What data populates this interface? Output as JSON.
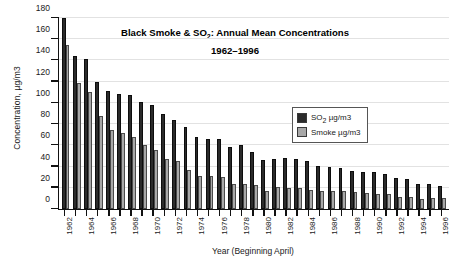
{
  "chart_data": {
    "type": "bar",
    "title": "Black Smoke & SO2: Annual Mean Concentrations",
    "title_line1": "Black Smoke & SO",
    "title_line1_sub": "2",
    "title_line1_rest": ": Annual Mean Concentrations",
    "subtitle": "1962–1996",
    "xlabel": "Year (Beginning April)",
    "ylabel": "Concentration, µg/m3",
    "ylim": [
      0,
      180
    ],
    "ytick_step": 20,
    "yticks": [
      0,
      20,
      40,
      60,
      80,
      100,
      120,
      140,
      160,
      180
    ],
    "grid": true,
    "legend_position": "upper-right-inside",
    "categories": [
      "1962",
      "1963",
      "1964",
      "1965",
      "1966",
      "1967",
      "1968",
      "1969",
      "1970",
      "1971",
      "1972",
      "1973",
      "1974",
      "1975",
      "1976",
      "1977",
      "1978",
      "1979",
      "1980",
      "1981",
      "1982",
      "1983",
      "1984",
      "1985",
      "1986",
      "1987",
      "1988",
      "1989",
      "1990",
      "1991",
      "1992",
      "1993",
      "1994",
      "1995",
      "1996"
    ],
    "xtick_labels": [
      "1962",
      "",
      "1964",
      "",
      "1966",
      "",
      "1968",
      "",
      "1970",
      "",
      "1972",
      "",
      "1974",
      "",
      "1976",
      "",
      "1978",
      "",
      "1980",
      "",
      "1982",
      "",
      "1984",
      "",
      "1986",
      "",
      "1988",
      "",
      "1990",
      "",
      "1992",
      "",
      "1994",
      "",
      "1996"
    ],
    "series": [
      {
        "name": "SO2 µg/m3",
        "label": "SO2 µg/m3",
        "color": "#2b2b2b",
        "values": [
          180,
          144,
          141,
          120,
          111,
          108,
          107,
          101,
          98,
          90,
          84,
          77,
          68,
          66,
          66,
          58,
          60,
          54,
          46,
          47,
          48,
          47,
          45,
          41,
          40,
          39,
          36,
          35,
          35,
          33,
          29,
          28,
          24,
          24,
          22
        ]
      },
      {
        "name": "Smoke µg/m3",
        "label": "Smoke µg/m3",
        "color": "#a8a8a8",
        "values": [
          155,
          119,
          110,
          88,
          74,
          72,
          68,
          60,
          56,
          47,
          45,
          37,
          31,
          31,
          30,
          24,
          24,
          23,
          17,
          21,
          20,
          20,
          18,
          17,
          17,
          17,
          16,
          15,
          14,
          14,
          11,
          11,
          9,
          10,
          10
        ]
      }
    ]
  },
  "legend": {
    "entries": [
      {
        "label": "SO2 µg/m3",
        "swatch": "so2"
      },
      {
        "label": "Smoke µg/m3",
        "swatch": "smoke"
      }
    ]
  }
}
